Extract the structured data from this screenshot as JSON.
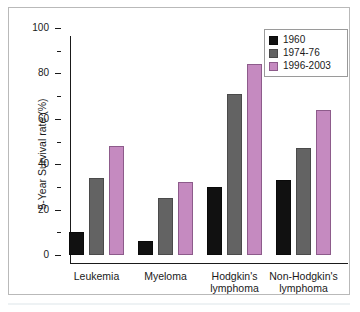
{
  "chart_data": {
    "type": "bar",
    "title": "",
    "xlabel": "",
    "ylabel": "5-Year Survival rate (%)",
    "ylim": [
      0,
      100
    ],
    "ytick_labels": [
      "0",
      "20",
      "40",
      "60",
      "80",
      "100"
    ],
    "ytick_values": [
      0,
      20,
      40,
      60,
      80,
      100
    ],
    "yminor_values": [
      10,
      30,
      50,
      70,
      90
    ],
    "grid": false,
    "legend_position": "top-right",
    "categories": [
      "Leukemia",
      "Myeloma",
      "Hodgkin's\nlymphoma",
      "Non-Hodgkin's\nlymphoma"
    ],
    "series": [
      {
        "name": "1960",
        "color": "#111111",
        "values": [
          10,
          6,
          30,
          33
        ]
      },
      {
        "name": "1974-76",
        "color": "#636363",
        "values": [
          34,
          25,
          71,
          47
        ]
      },
      {
        "name": "1996-2003",
        "color": "#c58ac0",
        "values": [
          48,
          32,
          84,
          64
        ]
      }
    ]
  },
  "axis": {
    "y_title": "5-Year Survival rate (%)"
  },
  "legend": {
    "entries": [
      {
        "label": "1960"
      },
      {
        "label": "1974-76"
      },
      {
        "label": "1996-2003"
      }
    ]
  },
  "colors": {
    "series_1960": "#111111",
    "series_1974_76": "#636363",
    "series_1996_2003": "#c58ac0",
    "axis": "#1a1a1a",
    "frame": "#b9b9b9",
    "background": "#ffffff"
  }
}
